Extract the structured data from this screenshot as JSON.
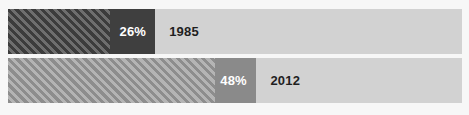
{
  "chart_data": {
    "type": "bar",
    "orientation": "horizontal",
    "title": "",
    "subtitle": "",
    "xlabel": "",
    "ylabel": "",
    "grid": false,
    "legend": "none",
    "xlim": [
      0,
      100
    ],
    "categories": [
      "1985",
      "2012"
    ],
    "values": [
      26,
      48
    ],
    "value_labels": [
      "26%",
      "48%"
    ],
    "series": [
      {
        "name": "Share",
        "values": [
          26,
          48
        ]
      }
    ],
    "bars": [
      {
        "category": "1985",
        "value": 26,
        "value_label": "26%",
        "year_label": "1985",
        "fill_color": "#3f3f3f",
        "hatch_color": "#555555",
        "track_color": "#d2d2d2",
        "value_text_color": "#ffffff",
        "year_text_color": "#1f1f1f"
      },
      {
        "category": "2012",
        "value": 48,
        "value_label": "48%",
        "year_label": "2012",
        "fill_color": "#8a8a8a",
        "hatch_color": "#a2a2a2",
        "track_color": "#d2d2d2",
        "value_text_color": "#ffffff",
        "year_text_color": "#1f1f1f"
      }
    ]
  },
  "colors": {
    "background": "#f7f7f7",
    "track": "#d2d2d2",
    "bar_1_solid": "#3f3f3f",
    "bar_1_hatch": "#555555",
    "bar_2_solid": "#8a8a8a",
    "bar_2_hatch": "#a2a2a2",
    "value_text": "#ffffff",
    "year_text": "#1f1f1f"
  },
  "geometry": {
    "bar_1": {
      "hatch_end_pct": 22.5,
      "block_end_pct": 32.4
    },
    "bar_2": {
      "hatch_end_pct": 45.6,
      "block_end_pct": 54.6
    },
    "year_label_offset_pct": {
      "bar_1": 35.5,
      "bar_2": 57.8
    }
  }
}
